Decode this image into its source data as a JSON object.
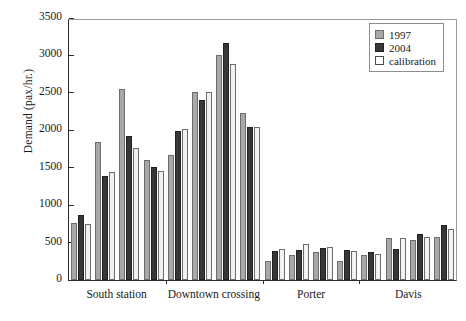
{
  "chart_data": {
    "type": "bar",
    "title": "",
    "xlabel": "",
    "ylabel": "Demand (pax/hr.)",
    "ylim": [
      0,
      3500
    ],
    "yticks": [
      0,
      500,
      1000,
      1500,
      2000,
      2500,
      3000,
      3500
    ],
    "ytick_labels": [
      "0",
      "500",
      "1000",
      "1500",
      "2000",
      "2500",
      "3000",
      "3500"
    ],
    "grid": false,
    "legend_position": "top-right",
    "legend": [
      "1997",
      "2004",
      "calibration"
    ],
    "series_colors": {
      "1997": "#a8a8a8",
      "2004": "#373737",
      "calibration": "#f2f2f2"
    },
    "categories": [
      "South station",
      "Downtown crossing",
      "Porter",
      "Davis"
    ],
    "clusters_per_category": 4,
    "groups": [
      {
        "category": "South station",
        "clusters": [
          {
            "1997": 760,
            "2004": 870,
            "calibration": 750
          },
          {
            "1997": 1850,
            "2004": 1390,
            "calibration": 1440
          },
          {
            "1997": 2550,
            "2004": 1930,
            "calibration": 1760
          },
          {
            "1997": 1600,
            "2004": 1510,
            "calibration": 1460
          }
        ]
      },
      {
        "category": "Downtown crossing",
        "clusters": [
          {
            "1997": 1670,
            "2004": 1990,
            "calibration": 2020
          },
          {
            "1997": 2510,
            "2004": 2400,
            "calibration": 2510
          },
          {
            "1997": 3000,
            "2004": 3160,
            "calibration": 2890
          },
          {
            "1997": 2230,
            "2004": 2050,
            "calibration": 2050
          }
        ]
      },
      {
        "category": "Porter",
        "clusters": [
          {
            "1997": 260,
            "2004": 390,
            "calibration": 420
          },
          {
            "1997": 330,
            "2004": 400,
            "calibration": 480
          },
          {
            "1997": 370,
            "2004": 430,
            "calibration": 440
          },
          {
            "1997": 250,
            "2004": 400,
            "calibration": 390
          }
        ]
      },
      {
        "category": "Davis",
        "clusters": [
          {
            "1997": 330,
            "2004": 380,
            "calibration": 350
          },
          {
            "1997": 560,
            "2004": 410,
            "calibration": 560
          },
          {
            "1997": 540,
            "2004": 620,
            "calibration": 580
          },
          {
            "1997": 570,
            "2004": 730,
            "calibration": 680
          }
        ]
      }
    ]
  }
}
